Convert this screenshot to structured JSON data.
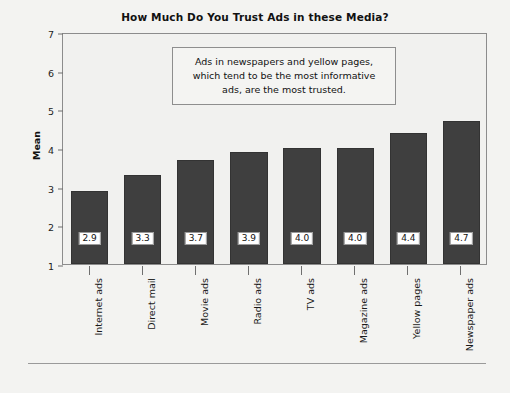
{
  "chart_data": {
    "type": "bar",
    "title": "How Much Do You Trust Ads in these Media?",
    "xlabel": "",
    "ylabel": "Mean",
    "ylim": [
      1,
      7
    ],
    "yticks": [
      1,
      2,
      3,
      4,
      5,
      6,
      7
    ],
    "ytick_labels": [
      "1",
      "2",
      "3",
      "4",
      "5",
      "6",
      "7"
    ],
    "grid": false,
    "legend": null,
    "categories": [
      "Internet ads",
      "Direct mail",
      "Movie ads",
      "Radio ads",
      "TV ads",
      "Magazine ads",
      "Yellow pages",
      "Newspaper ads"
    ],
    "values": [
      2.9,
      3.3,
      3.7,
      3.9,
      4.0,
      4.0,
      4.4,
      4.7
    ],
    "value_labels": [
      "2.9",
      "3.3",
      "3.7",
      "3.9",
      "4.0",
      "4.0",
      "4.4",
      "4.7"
    ],
    "bar_color": "#3f3f3f",
    "annotations": [
      {
        "text": "Ads in newspapers and yellow pages, which tend to be the most informative ads, are the most trusted.",
        "lines": [
          "Ads in newspapers and yellow pages,",
          "which tend to be the most informative",
          "ads, are the most trusted."
        ]
      }
    ]
  },
  "colors": {
    "background": "#f3f3f1",
    "bar": "#3f3f3f",
    "frame": "#8c8c8c",
    "text": "#1a1a1a"
  }
}
